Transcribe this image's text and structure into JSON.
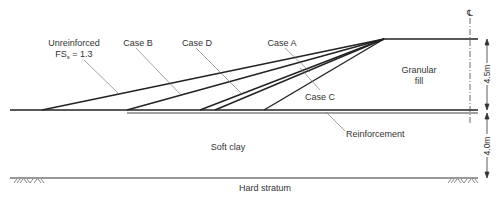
{
  "diagram": {
    "type": "embankment-cross-section",
    "labels": {
      "unreinforced_line1": "Unreinforced",
      "unreinforced_line2_main": "FS",
      "unreinforced_line2_sub": "s",
      "unreinforced_line2_rest": " = 1.3",
      "case_b": "Case B",
      "case_d": "Case D",
      "case_a": "Case A",
      "case_c": "Case C",
      "granular_fill_line1": "Granular",
      "granular_fill_line2": "fill",
      "reinforcement": "Reinforcement",
      "soft_clay": "Soft clay",
      "hard_stratum": "Hard stratum",
      "centerline_symbol": "℄"
    },
    "dimensions": {
      "embankment_height": "4.5m",
      "clay_thickness": "4.0m"
    },
    "slopes": [
      {
        "name": "Unreinforced FSs = 1.3",
        "toe_x": 42
      },
      {
        "name": "Case B",
        "toe_x": 127
      },
      {
        "name": "Case D",
        "toe_x": 200
      },
      {
        "name": "Case A",
        "toe_x": 215
      },
      {
        "name": "Case C",
        "toe_x": 264
      }
    ],
    "colors": {
      "line": "#222222",
      "leader": "#555555",
      "text": "#333333",
      "background": "#ffffff"
    }
  }
}
